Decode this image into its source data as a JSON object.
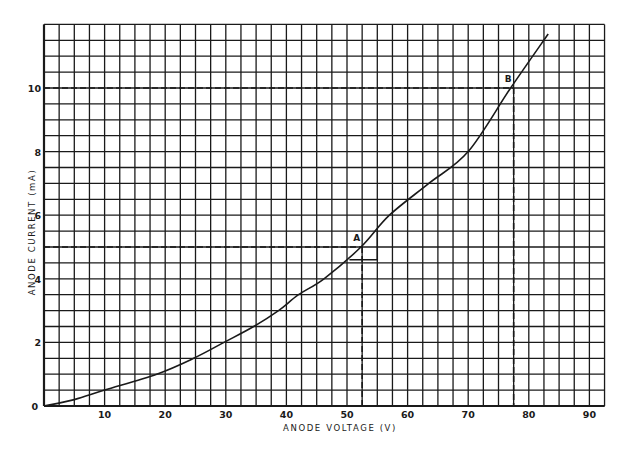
{
  "chart_data": {
    "type": "line",
    "title": "",
    "xlabel": "ANODE VOLTAGE (V)",
    "ylabel": "ANODE CURRENT (mA)",
    "xlim": [
      0,
      92.5
    ],
    "ylim": [
      0,
      12
    ],
    "grid": true,
    "grid_minor_x_step": 2.5,
    "grid_minor_y_step": 0.5,
    "x_ticks": [
      10,
      20,
      30,
      40,
      50,
      60,
      70,
      80,
      90
    ],
    "x_tick_labels": [
      "10",
      "20",
      "30",
      "40",
      "50",
      "60",
      "70",
      "80",
      "90"
    ],
    "y_ticks": [
      0,
      2,
      4,
      6,
      8,
      10
    ],
    "y_tick_labels": [
      "0",
      "2",
      "4",
      "6",
      "8",
      "10"
    ],
    "legend": null,
    "series": [
      {
        "name": "Anode characteristic",
        "x": [
          0,
          5,
          10,
          18.6,
          24.7,
          29.7,
          34.6,
          38.7,
          42,
          46.2,
          52.3,
          57,
          63.5,
          70,
          77,
          83.2
        ],
        "y": [
          0,
          0.2,
          0.5,
          1.0,
          1.5,
          2.0,
          2.5,
          3.0,
          3.5,
          4.0,
          5.0,
          6.0,
          7.0,
          8.0,
          10.0,
          11.7
        ]
      }
    ],
    "annotations": [
      {
        "label": "A",
        "x": 52.5,
        "y": 5.0,
        "dashed_guides": true,
        "tangent_triangle": {
          "x0": 50.4,
          "x1": 55.0,
          "y_base": 4.6,
          "y_top": 5.5
        }
      },
      {
        "label": "B",
        "x": 77.5,
        "y": 10.0,
        "dashed_guides": true
      }
    ]
  },
  "labels": {
    "x_axis_title": "ANODE VOLTAGE (V)",
    "y_axis_title": "ANODE CURRENT (mA)",
    "origin": "0",
    "point_a": "A",
    "point_b": "B"
  },
  "colors": {
    "ink": "#1a1a1a",
    "background": "#ffffff"
  }
}
